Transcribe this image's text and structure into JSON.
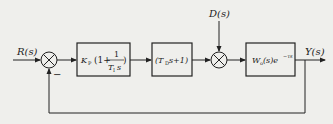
{
  "diagram": {
    "type": "control-block-diagram",
    "input_label": "R(s)",
    "disturbance_label": "D(s)",
    "output_label": "Y(s)",
    "feedback_sign": "−",
    "blocks": [
      {
        "name": "pid-controller",
        "gain": "K",
        "gain_sub": "P",
        "open": "(1+",
        "num": "1",
        "den_T": "T",
        "den_sub": "I",
        "den_s": "s",
        "close": ")"
      },
      {
        "name": "derivative-block",
        "pre": "(T",
        "sub": "D",
        "post": " s+1)"
      },
      {
        "name": "plant-block",
        "W": "W",
        "W_sub": "o",
        "mid": " (s)e",
        "exp": "−τs"
      }
    ]
  }
}
